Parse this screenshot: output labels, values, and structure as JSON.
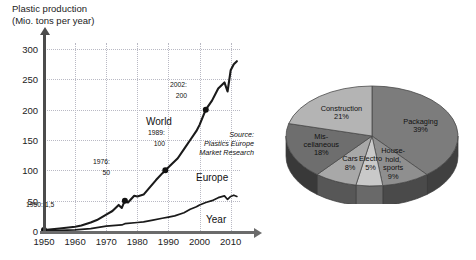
{
  "title": {
    "line1": "Plastic production",
    "line2": "(Mio. tons per year)"
  },
  "source_note": {
    "line1": "Source:",
    "line2": "Plastics Europe",
    "line3": "Market Research"
  },
  "labels": {
    "world": "World",
    "europe": "Europe",
    "year_axis": "Year"
  },
  "callouts": {
    "c1950": "1950: 1,5",
    "c1976_year": "1976:",
    "c1976_value": "50",
    "c1989_year": "1989:",
    "c1989_value": "100",
    "c2002_year": "2002:",
    "c2002_value": "200"
  },
  "chart_data": [
    {
      "type": "line",
      "title": "Plastic production (Mio. tons per year)",
      "xlabel": "Year",
      "ylabel": "Mio. tons per year",
      "xlim": [
        1950,
        2013
      ],
      "ylim": [
        0,
        310
      ],
      "yticks": [
        0,
        50,
        100,
        150,
        200,
        250,
        300
      ],
      "xticks": [
        1950,
        1960,
        1970,
        1980,
        1990,
        2000,
        2010
      ],
      "grid": true,
      "legend": "inline-labels",
      "annotations": [
        {
          "label": "1950: 1,5",
          "x": 1950,
          "y": 1.5
        },
        {
          "label": "1976: 50",
          "x": 1976,
          "y": 50
        },
        {
          "label": "1989: 100",
          "x": 1989,
          "y": 100
        },
        {
          "label": "2002: 200",
          "x": 2002,
          "y": 200
        }
      ],
      "series": [
        {
          "name": "World",
          "x": [
            1950,
            1955,
            1960,
            1962,
            1965,
            1967,
            1970,
            1972,
            1974,
            1975,
            1976,
            1977,
            1979,
            1980,
            1982,
            1984,
            1986,
            1988,
            1989,
            1991,
            1993,
            1995,
            1997,
            1999,
            2000,
            2002,
            2004,
            2006,
            2008,
            2009,
            2010,
            2011,
            2012
          ],
          "values": [
            1.5,
            4,
            7,
            9,
            14,
            18,
            27,
            33,
            43,
            38,
            50,
            47,
            58,
            57,
            60,
            72,
            84,
            95,
            100,
            110,
            120,
            135,
            150,
            165,
            175,
            200,
            215,
            235,
            245,
            230,
            265,
            275,
            280
          ]
        },
        {
          "name": "Europe",
          "x": [
            1950,
            1955,
            1960,
            1965,
            1970,
            1975,
            1976,
            1980,
            1982,
            1985,
            1988,
            1990,
            1992,
            1995,
            1997,
            1999,
            2000,
            2002,
            2004,
            2006,
            2008,
            2009,
            2010,
            2011,
            2012
          ],
          "values": [
            0.5,
            1,
            2,
            4,
            8,
            10,
            12,
            14,
            15,
            18,
            21,
            23,
            25,
            30,
            36,
            40,
            43,
            47,
            50,
            55,
            58,
            52,
            57,
            59,
            57
          ]
        }
      ]
    },
    {
      "type": "pie",
      "title": "Plastic use by sector",
      "categories": [
        "Packaging",
        "Household, sports",
        "Electro",
        "Cars",
        "Miscellaneous",
        "Construction"
      ],
      "values": [
        39,
        9,
        5,
        8,
        18,
        21
      ],
      "labels": [
        {
          "name_line1": "Packaging",
          "name_line2": "",
          "name_line3": "",
          "pct": "39%"
        },
        {
          "name_line1": "House-",
          "name_line2": "hold,",
          "name_line3": "sports",
          "pct": "9%"
        },
        {
          "name_line1": "Electro",
          "name_line2": "",
          "name_line3": "",
          "pct": "5%"
        },
        {
          "name_line1": "Cars",
          "name_line2": "",
          "name_line3": "",
          "pct": "8%"
        },
        {
          "name_line1": "Mis-",
          "name_line2": "cellaneous",
          "name_line3": "",
          "pct": "18%"
        },
        {
          "name_line1": "Construction",
          "name_line2": "",
          "name_line3": "",
          "pct": "21%"
        }
      ],
      "colors": [
        "#7c7c7c",
        "#8f8f8f",
        "#c9c9c9",
        "#a8a8a8",
        "#6e6e6e",
        "#b4b4b4"
      ],
      "style": "3d-exploded-grayscale"
    }
  ]
}
